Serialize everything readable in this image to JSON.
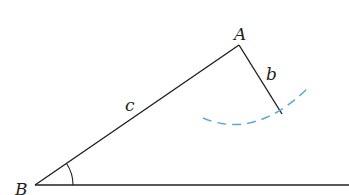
{
  "diagram": {
    "type": "triangle-construction",
    "colors": {
      "line": "#231f20",
      "arc": "#5aaad8",
      "background": "#ffffff"
    },
    "vertices": {
      "A": {
        "label": "A",
        "x": 239,
        "y": 45
      },
      "B": {
        "label": "B",
        "x": 35,
        "y": 185
      }
    },
    "sides": {
      "b": {
        "label": "b",
        "from": "A",
        "to": "b_end"
      },
      "c": {
        "label": "c",
        "from": "B",
        "to": "A"
      }
    },
    "b_end": {
      "x": 282,
      "y": 114
    },
    "baseline": {
      "from_x": 35,
      "to_x": 349,
      "y": 185
    },
    "angle_marker": {
      "at": "B",
      "radius": 38
    },
    "arc": {
      "style": "dashed",
      "center": "A",
      "radius": 81
    }
  },
  "labels": {
    "A": "A",
    "B": "B",
    "b": "b",
    "c": "c"
  }
}
